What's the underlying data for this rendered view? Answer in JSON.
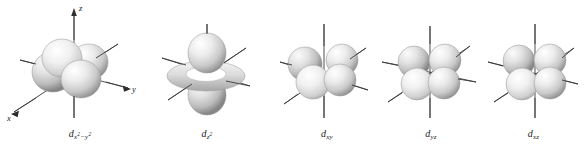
{
  "figure": {
    "background_color": "#ffffff",
    "width": 585,
    "height": 145,
    "lobe_fill_light": "#fdfdfd",
    "lobe_fill_mid": "#d8d8d8",
    "lobe_fill_dark": "#8f8f8f",
    "lobe_outline": "#9a9a9a",
    "axis_color": "#3a3a3a",
    "label_color": "#1a1a1a"
  },
  "axes": {
    "x_label": "x",
    "y_label": "y",
    "z_label": "z"
  },
  "orbitals": [
    {
      "id": "dx2-y2",
      "label_base": "d",
      "label_sub": "x",
      "label_sub_sup1": "2",
      "label_sub_mid": "−y",
      "label_sub_sup2": "2",
      "label_plain": "d x²−y²",
      "show_axis_labels": true,
      "show_arrows": true,
      "lobe_count": 4,
      "has_torus": false,
      "description": "four lobes along the x and y axes"
    },
    {
      "id": "dz2",
      "label_base": "d",
      "label_sub": "z",
      "label_sub_sup1": "2",
      "label_sub_mid": "",
      "label_sub_sup2": "",
      "label_plain": "d z²",
      "show_axis_labels": false,
      "show_arrows": false,
      "lobe_count": 2,
      "has_torus": true,
      "description": "two lobes along z with a torus in the xy plane"
    },
    {
      "id": "dxy",
      "label_base": "d",
      "label_sub": "xy",
      "label_sub_sup1": "",
      "label_sub_mid": "",
      "label_sub_sup2": "",
      "label_plain": "d xy",
      "show_axis_labels": false,
      "show_arrows": false,
      "lobe_count": 4,
      "has_torus": false,
      "description": "four lobes between the x and y axes"
    },
    {
      "id": "dyz",
      "label_base": "d",
      "label_sub": "yz",
      "label_sub_sup1": "",
      "label_sub_mid": "",
      "label_sub_sup2": "",
      "label_plain": "d yz",
      "show_axis_labels": false,
      "show_arrows": false,
      "lobe_count": 4,
      "has_torus": false,
      "description": "four lobes between the y and z axes"
    },
    {
      "id": "dxz",
      "label_base": "d",
      "label_sub": "xz",
      "label_sub_sup1": "",
      "label_sub_mid": "",
      "label_sub_sup2": "",
      "label_plain": "d xz",
      "show_axis_labels": false,
      "show_arrows": false,
      "lobe_count": 4,
      "has_torus": false,
      "description": "four lobes between the x and z axes"
    }
  ]
}
